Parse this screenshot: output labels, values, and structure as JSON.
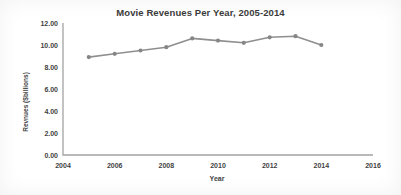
{
  "chart_data": {
    "type": "line",
    "title": "Movie Revenues Per Year, 2005-2014",
    "xlabel": "Year",
    "ylabel": "Revnues ($billions)",
    "x": [
      2005,
      2006,
      2007,
      2008,
      2009,
      2010,
      2011,
      2012,
      2013,
      2014
    ],
    "series": [
      {
        "name": "Movie Revenues",
        "values": [
          8.9,
          9.2,
          9.5,
          9.8,
          10.6,
          10.4,
          10.2,
          10.7,
          10.8,
          10.0
        ]
      }
    ],
    "xlim": [
      2004,
      2016
    ],
    "ylim": [
      0,
      12
    ],
    "x_ticks": [
      2004,
      2006,
      2008,
      2010,
      2012,
      2014,
      2016
    ],
    "x_tick_labels": [
      "2004",
      "2006",
      "2008",
      "2010",
      "2012",
      "2014",
      "2016"
    ],
    "y_ticks": [
      0,
      2,
      4,
      6,
      8,
      10,
      12
    ],
    "y_tick_labels": [
      "0.00",
      "2.00",
      "4.00",
      "6.00",
      "8.00",
      "10.00",
      "12.00"
    ],
    "grid": false,
    "legend": false,
    "colors": {
      "line": "#8f8f8f",
      "marker": "#868686",
      "axis": "#a3a3a3",
      "text": "#3f3f3f",
      "title": "#3b3b3b"
    }
  }
}
